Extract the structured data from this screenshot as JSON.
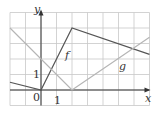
{
  "diagram": {
    "type": "function-graph",
    "grid": {
      "x_min": -2,
      "x_max": 7,
      "y_min": -1,
      "y_max": 5,
      "spacing": 1
    },
    "axes": {
      "x_label": "x",
      "y_label": "y",
      "origin_label": "0",
      "x_tick_label": "1",
      "y_tick_label": "1"
    },
    "functions": [
      {
        "name": "f",
        "label": "f",
        "color": "#555555",
        "points": [
          [
            -2,
            0.5
          ],
          [
            0,
            0
          ],
          [
            2,
            4
          ],
          [
            7,
            2.3
          ]
        ]
      },
      {
        "name": "g",
        "label": "g",
        "color": "#b5b5b5",
        "points": [
          [
            -2,
            4
          ],
          [
            2,
            0
          ],
          [
            7,
            3.4
          ]
        ]
      }
    ],
    "colors": {
      "grid": "#c8c8c8",
      "axis": "#333333"
    }
  }
}
